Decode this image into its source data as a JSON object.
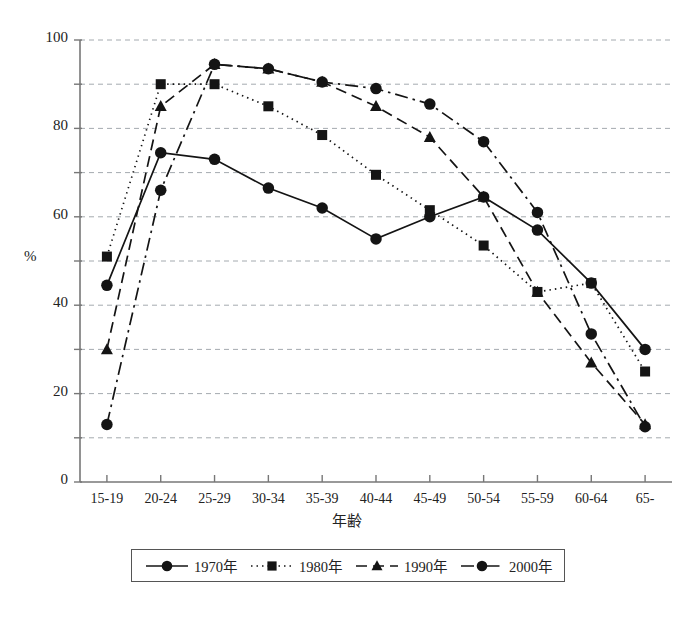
{
  "chart_data": {
    "type": "line",
    "title": "",
    "xlabel": "年齢",
    "ylabel": "%",
    "categories": [
      "15-19",
      "20-24",
      "25-29",
      "30-34",
      "35-39",
      "40-44",
      "45-49",
      "50-54",
      "55-59",
      "60-64",
      "65-"
    ],
    "ylim": [
      0,
      100
    ],
    "yticks": [
      0,
      20,
      40,
      60,
      80,
      100
    ],
    "yminor": [
      10,
      30,
      50,
      70,
      90
    ],
    "grid": true,
    "legend_position": "bottom",
    "series": [
      {
        "name": "1970年",
        "marker": "circle",
        "line": "solid",
        "values": [
          44.5,
          74.5,
          73.0,
          66.5,
          62.0,
          55.0,
          60.0,
          64.5,
          57.0,
          45.0,
          30.0
        ]
      },
      {
        "name": "1980年",
        "marker": "square",
        "line": "dotted",
        "values": [
          51.0,
          90.0,
          90.0,
          85.0,
          78.5,
          69.5,
          61.5,
          53.5,
          43.0,
          45.0,
          25.0
        ]
      },
      {
        "name": "1990年",
        "marker": "triangle",
        "line": "dashed",
        "values": [
          30.0,
          85.0,
          94.5,
          93.5,
          90.5,
          85.0,
          78.0,
          64.5,
          43.0,
          27.0,
          13.0
        ]
      },
      {
        "name": "2000年",
        "marker": "circle",
        "line": "dashdot",
        "values": [
          13.0,
          66.0,
          94.5,
          93.5,
          90.5,
          89.0,
          85.5,
          77.0,
          61.0,
          33.5,
          12.5
        ]
      }
    ]
  },
  "legend": {
    "items": [
      {
        "label": "1970年"
      },
      {
        "label": "1980年"
      },
      {
        "label": "1990年"
      },
      {
        "label": "2000年"
      }
    ]
  }
}
